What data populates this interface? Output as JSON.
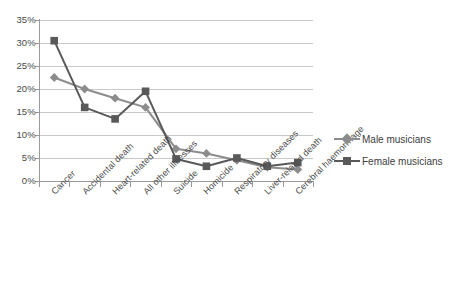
{
  "chart_data": {
    "type": "line",
    "title": "",
    "subtitle": "",
    "xlabel": "",
    "ylabel": "",
    "ylim": [
      0,
      35
    ],
    "ytick_step": 5,
    "ytick_labels": [
      "0%",
      "5%",
      "10%",
      "15%",
      "20%",
      "25%",
      "30%",
      "35%"
    ],
    "ytick_values": [
      0,
      5,
      10,
      15,
      20,
      25,
      30,
      35
    ],
    "grid": true,
    "legend_position": "right",
    "categories": [
      "Cancer",
      "Accidental death",
      "Heart-related death",
      "All other illnesses",
      "Suicide",
      "Homicide",
      "Respiratory diseases",
      "Liver-related death",
      "Cerebral haemorrhage"
    ],
    "series": [
      {
        "name": "Male musicians",
        "color": "#8c8c8c",
        "marker": "diamond",
        "values": [
          22.5,
          20.0,
          18.0,
          16.0,
          7.0,
          6.0,
          4.5,
          3.0,
          2.5
        ]
      },
      {
        "name": "Female musicians",
        "color": "#595959",
        "marker": "square",
        "values": [
          30.5,
          16.0,
          13.5,
          19.5,
          4.8,
          3.2,
          5.0,
          3.2,
          4.0
        ]
      }
    ]
  },
  "legend": {
    "items": [
      {
        "label": "Male musicians"
      },
      {
        "label": "Female musicians"
      }
    ]
  },
  "caption": {
    "text": ""
  }
}
